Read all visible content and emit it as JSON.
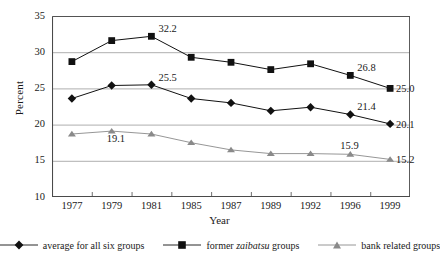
{
  "chart_data": {
    "type": "line",
    "title": "",
    "xlabel": "Year",
    "ylabel": "Percent",
    "categories": [
      "1977",
      "1979",
      "1981",
      "1985",
      "1987",
      "1989",
      "1992",
      "1996",
      "1999"
    ],
    "ylim": [
      10,
      35
    ],
    "yticks": [
      "10",
      "15",
      "20",
      "25",
      "30",
      "35"
    ],
    "grid": true,
    "legend_position": "bottom",
    "series": [
      {
        "name": "average for all six groups",
        "marker": "diamond",
        "color": "#111111",
        "values": [
          23.6,
          25.4,
          25.5,
          23.6,
          23.0,
          21.9,
          22.4,
          21.4,
          20.1
        ],
        "point_labels": [
          null,
          null,
          "25.5",
          null,
          null,
          null,
          null,
          "21.4",
          "20.1"
        ]
      },
      {
        "name": "former zaibatsu groups",
        "marker": "square",
        "color": "#111111",
        "values": [
          28.7,
          31.6,
          32.2,
          29.3,
          28.6,
          27.6,
          28.4,
          26.8,
          25.0
        ],
        "point_labels": [
          null,
          null,
          "32.2",
          null,
          null,
          null,
          null,
          "26.8",
          "25.0"
        ]
      },
      {
        "name": "bank related groups",
        "marker": "triangle",
        "color": "#8a8a8a",
        "values": [
          18.7,
          19.1,
          18.7,
          17.5,
          16.5,
          16.0,
          16.0,
          15.9,
          15.2
        ],
        "point_labels": [
          null,
          "19.1",
          null,
          null,
          null,
          null,
          null,
          "15.9",
          "15.2"
        ]
      }
    ]
  },
  "legend": {
    "items": [
      {
        "label_pre": "average for all six groups",
        "label_ital": "",
        "label_post": "",
        "marker": "diamond"
      },
      {
        "label_pre": "former ",
        "label_ital": "zaibatsu",
        "label_post": " groups",
        "marker": "square"
      },
      {
        "label_pre": "bank related groups",
        "label_ital": "",
        "label_post": "",
        "marker": "triangle"
      }
    ]
  }
}
